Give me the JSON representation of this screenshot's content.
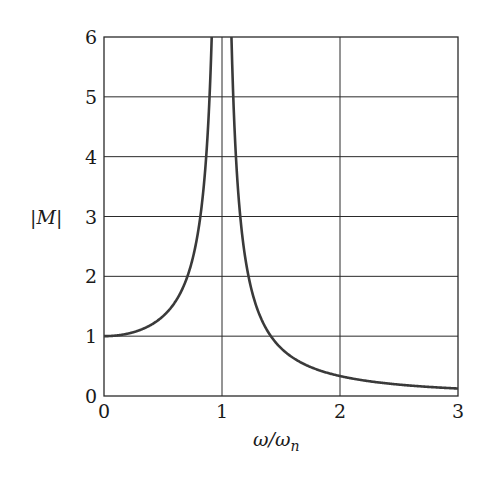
{
  "chart_data": {
    "type": "line",
    "title": "",
    "xlabel": "ω/ωn",
    "ylabel": "|M|",
    "xlim": [
      0,
      3
    ],
    "ylim": [
      0,
      6
    ],
    "xticks": [
      0,
      1,
      2,
      3
    ],
    "yticks": [
      0,
      1,
      2,
      3,
      4,
      5,
      6
    ],
    "grid": true,
    "legend": null,
    "series": [
      {
        "name": "|M| = 1/|1-(ω/ωn)^2|",
        "color": "#3a3a3a",
        "x": [
          0,
          0.2,
          0.4,
          0.5,
          0.6,
          0.7,
          0.8,
          0.85,
          0.9,
          0.91,
          1.09,
          1.1,
          1.2,
          1.3,
          1.4,
          1.5,
          1.75,
          2.0,
          2.5,
          3.0
        ],
        "y": [
          1.0,
          1.04,
          1.19,
          1.33,
          1.56,
          1.96,
          2.78,
          3.6,
          5.26,
          6.0,
          6.0,
          4.76,
          2.27,
          1.45,
          1.04,
          0.8,
          0.48,
          0.333,
          0.19,
          0.125
        ]
      }
    ]
  },
  "labels": {
    "ylabel": "|M|",
    "xlabel_main": "ω/ω",
    "xlabel_sub": "n",
    "yticks": [
      "0",
      "1",
      "2",
      "3",
      "4",
      "5",
      "6"
    ],
    "xticks": [
      "0",
      "1",
      "2",
      "3"
    ]
  },
  "colors": {
    "curve": "#3a3a3a",
    "grid": "#2a2a2a",
    "frame": "#2a2a2a",
    "background": "#ffffff"
  }
}
